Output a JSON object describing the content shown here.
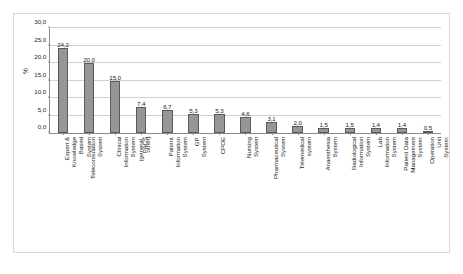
{
  "chart_data": {
    "type": "bar",
    "title": "",
    "xlabel": "",
    "ylabel": "%",
    "ylim": [
      0,
      30
    ],
    "ytick_labels": [
      "0,0",
      "5,0",
      "10,0",
      "15,0",
      "20,0",
      "25,0",
      "30,0"
    ],
    "ytick_values": [
      0,
      5,
      10,
      15,
      20,
      25,
      30
    ],
    "grid": true,
    "legend": false,
    "decimal_separator": ",",
    "bar_color": "#969696",
    "bar_edge_color": "#5a5a5a",
    "grid_color": "#d0d0d0",
    "axis_color": "#8c8c8c",
    "categories": [
      "Expert & Knowledge Based\nSystem",
      "Teleconsulation System",
      "Clinical Information System\n(general, other)",
      "PACS",
      "Patient Information System",
      "GP System",
      "CPOE",
      "Nursing System",
      "Pharmaceutical System",
      "Telemedical system",
      "Anaesthesia System",
      "Radiological Information System",
      "Lab Information System",
      "Patient Data Management System",
      "Operation Unit System"
    ],
    "values": [
      24.2,
      20.0,
      15.0,
      7.4,
      6.7,
      5.3,
      5.3,
      4.6,
      3.1,
      2.0,
      1.5,
      1.5,
      1.4,
      1.4,
      0.5
    ],
    "value_labels": [
      "24,2",
      "20,0",
      "15,0",
      "7,4",
      "6,7",
      "5,3",
      "5,3",
      "4,6",
      "3,1",
      "2,0",
      "1,5",
      "1,5",
      "1,4",
      "1,4",
      "0,5"
    ]
  }
}
